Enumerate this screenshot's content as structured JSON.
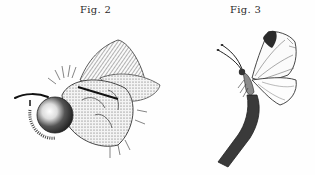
{
  "figures": [
    {
      "caption": "Fig. 2",
      "subject": "fly (lateral view, stippled engraving)"
    },
    {
      "caption": "Fig. 3",
      "subject": "white butterfly perched on a stem"
    }
  ],
  "colors": {
    "background": "#fefefe",
    "ink": "#2a2a2a",
    "stipple": "#555555"
  }
}
